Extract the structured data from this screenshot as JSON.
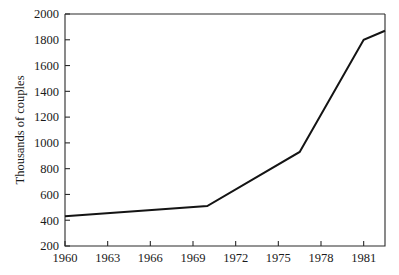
{
  "chart_data": {
    "type": "line",
    "title": "",
    "xlabel": "",
    "ylabel": "Thousands of couples",
    "xlim": [
      1960,
      1982.5
    ],
    "ylim": [
      200,
      2000
    ],
    "grid": false,
    "legend": null,
    "x_ticks": [
      1960,
      1963,
      1966,
      1969,
      1972,
      1975,
      1978,
      1981
    ],
    "x_tick_labels": [
      "1960",
      "1963",
      "1966",
      "1969",
      "1972",
      "1975",
      "1978",
      "1981"
    ],
    "y_ticks": [
      200,
      400,
      600,
      800,
      1000,
      1200,
      1400,
      1600,
      1800,
      2000
    ],
    "y_tick_labels": [
      "200",
      "400",
      "600",
      "800",
      "1000",
      "1200",
      "1400",
      "1600",
      "1800",
      "2000"
    ],
    "series": [
      {
        "name": "Unmarried couples",
        "color": "#141414",
        "x": [
          1960,
          1970,
          1976.5,
          1981,
          1982.5
        ],
        "values": [
          430,
          510,
          930,
          1800,
          1870
        ]
      }
    ]
  },
  "axis": {
    "y_title": "Thousands of couples"
  },
  "colors": {
    "line": "#141414",
    "axis": "#2a2a2a",
    "background": "#ffffff",
    "text": "#1a1a1a"
  }
}
